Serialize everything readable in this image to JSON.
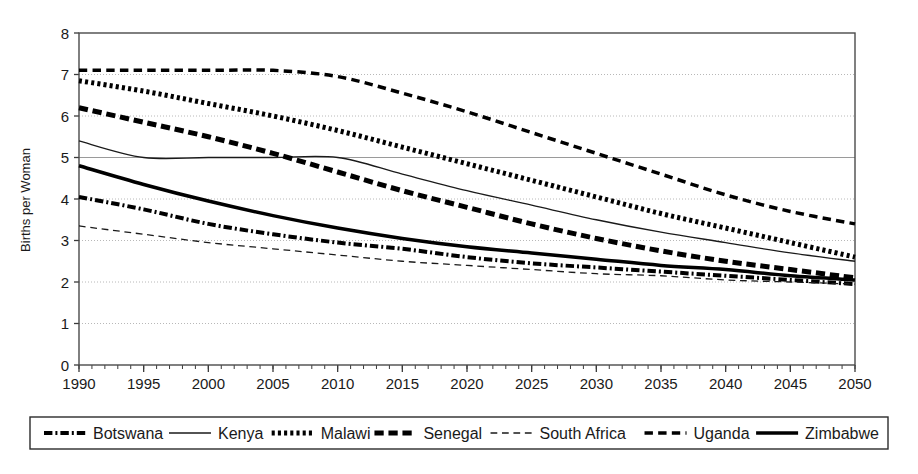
{
  "chart_data": {
    "type": "line",
    "title": "",
    "xlabel": "",
    "ylabel": "Births per Woman",
    "xlim": [
      1990,
      2050
    ],
    "ylim": [
      0,
      8
    ],
    "ytick_labels": [
      "0",
      "1",
      "2",
      "3",
      "4",
      "5",
      "6",
      "7",
      "8"
    ],
    "ytick_values": [
      0,
      1,
      2,
      3,
      4,
      5,
      6,
      7,
      8
    ],
    "xtick_labels": [
      "1990",
      "1995",
      "2000",
      "2005",
      "2010",
      "2015",
      "2020",
      "2025",
      "2030",
      "2035",
      "2040",
      "2045",
      "2050"
    ],
    "xtick_values": [
      1990,
      1995,
      2000,
      2005,
      2010,
      2015,
      2020,
      2025,
      2030,
      2035,
      2040,
      2045,
      2050
    ],
    "minor_xtick_step": 1,
    "grid": "horizontal-dotted",
    "legend_position": "bottom",
    "x": [
      1990,
      1995,
      2000,
      2005,
      2010,
      2015,
      2020,
      2025,
      2030,
      2035,
      2040,
      2045,
      2050
    ],
    "series": [
      {
        "name": "Botswana",
        "style": "dash-dot",
        "width": 4,
        "color": "#000000",
        "values": [
          4.05,
          3.75,
          3.4,
          3.15,
          2.95,
          2.8,
          2.6,
          2.45,
          2.35,
          2.25,
          2.15,
          2.05,
          1.95
        ]
      },
      {
        "name": "Kenya",
        "style": "solid",
        "width": 1.3,
        "color": "#1a1a1a",
        "values": [
          5.4,
          5.0,
          5.0,
          5.0,
          5.0,
          4.6,
          4.2,
          3.85,
          3.5,
          3.2,
          2.95,
          2.7,
          2.5
        ]
      },
      {
        "name": "Malawi",
        "style": "dotted",
        "width": 5,
        "color": "#000000",
        "values": [
          6.85,
          6.6,
          6.3,
          6.0,
          5.65,
          5.25,
          4.85,
          4.45,
          4.05,
          3.65,
          3.3,
          2.95,
          2.6
        ]
      },
      {
        "name": "Senegal",
        "style": "dashed",
        "width": 5,
        "color": "#000000",
        "values": [
          6.2,
          5.85,
          5.5,
          5.1,
          4.65,
          4.2,
          3.8,
          3.4,
          3.05,
          2.75,
          2.5,
          2.3,
          2.1
        ]
      },
      {
        "name": "South Africa",
        "style": "dashed",
        "width": 1.3,
        "color": "#1a1a1a",
        "values": [
          3.35,
          3.15,
          2.95,
          2.8,
          2.65,
          2.5,
          2.4,
          2.3,
          2.2,
          2.15,
          2.05,
          2.0,
          1.95
        ]
      },
      {
        "name": "Uganda",
        "style": "dashed",
        "width": 3.5,
        "color": "#000000",
        "values": [
          7.1,
          7.1,
          7.1,
          7.1,
          6.95,
          6.55,
          6.1,
          5.6,
          5.1,
          4.6,
          4.1,
          3.7,
          3.4
        ]
      },
      {
        "name": "Zimbabwe",
        "style": "solid",
        "width": 3.5,
        "color": "#000000",
        "values": [
          4.8,
          4.35,
          3.95,
          3.6,
          3.3,
          3.05,
          2.85,
          2.7,
          2.55,
          2.4,
          2.3,
          2.15,
          2.05
        ]
      }
    ]
  },
  "legend": {
    "items": [
      {
        "label": "Botswana"
      },
      {
        "label": "Kenya"
      },
      {
        "label": "Malawi"
      },
      {
        "label": "Senegal"
      },
      {
        "label": "South Africa"
      },
      {
        "label": "Uganda"
      },
      {
        "label": "Zimbabwe"
      }
    ]
  }
}
